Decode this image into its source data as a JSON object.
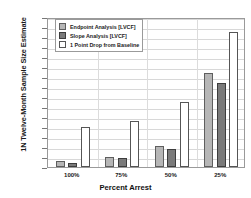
{
  "chart_data": {
    "type": "bar",
    "title": "",
    "xlabel": "Percent Arrest",
    "ylabel": "1N Twelve-Month Sample Size Estimate",
    "categories": [
      "100%",
      "75%",
      "50%",
      "25%"
    ],
    "ylim": [
      0,
      1500
    ],
    "yticks": [
      0,
      100,
      200,
      300,
      400,
      500,
      600,
      700,
      800,
      900,
      1000,
      1100,
      1200,
      1300,
      1400,
      1500
    ],
    "grid": true,
    "legend_position": "top-left",
    "series": [
      {
        "name": "Endpoint Analysis [LVCF]",
        "key": "endpoint",
        "color": "#b6b6b6",
        "values": [
          60,
          100,
          210,
          940
        ]
      },
      {
        "name": "Slope Analysis [LVCF]",
        "key": "slope",
        "color": "#7a7a7a",
        "values": [
          45,
          90,
          180,
          840
        ]
      },
      {
        "name": "1 Point Drop from Baseline",
        "key": "onepoint",
        "color": "#ffffff",
        "values": [
          400,
          460,
          650,
          1350
        ]
      }
    ]
  },
  "legend": {
    "items": [
      {
        "label": "Endpoint Analysis [LVCF]",
        "key": "endpoint"
      },
      {
        "label": "Slope Analysis [LVCF]",
        "key": "slope"
      },
      {
        "label": "1 Point Drop from Baseline",
        "key": "onepoint"
      }
    ]
  }
}
